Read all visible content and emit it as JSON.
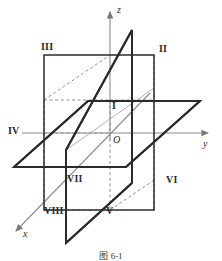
{
  "figure": {
    "caption": "图 6-1",
    "colors": {
      "solid_line": "#2b2b2b",
      "dashed_line": "#8a8a8a",
      "thin_line": "#9a9a9a",
      "axis": "#7a7a7a",
      "text": "#2b2b2b",
      "background": "#ffffff"
    }
  },
  "axes": [
    {
      "id": "z",
      "label": "z",
      "direction": "up"
    },
    {
      "id": "y",
      "label": "y",
      "direction": "right"
    },
    {
      "id": "x",
      "label": "x",
      "direction": "down-left"
    }
  ],
  "origin": {
    "label": "O"
  },
  "octants": [
    {
      "id": "I",
      "label": "I"
    },
    {
      "id": "II",
      "label": "II"
    },
    {
      "id": "III",
      "label": "III"
    },
    {
      "id": "IV",
      "label": "IV"
    },
    {
      "id": "V",
      "label": "V"
    },
    {
      "id": "VI",
      "label": "VI"
    },
    {
      "id": "VII",
      "label": "VII"
    },
    {
      "id": "VIII",
      "label": "VIII"
    }
  ]
}
